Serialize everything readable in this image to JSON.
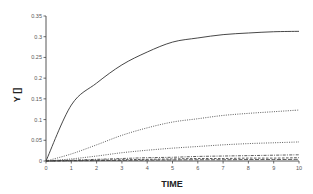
{
  "chart_data": {
    "type": "line",
    "title": "",
    "xlabel": "TIME",
    "ylabel": "Y []",
    "xlim": [
      0,
      10
    ],
    "ylim": [
      0,
      0.35
    ],
    "grid": false,
    "legend": "none",
    "x_ticks": [
      "0",
      "1",
      "2",
      "3",
      "4",
      "5",
      "6",
      "7",
      "8",
      "9",
      "10"
    ],
    "y_ticks": [
      "0",
      "0.05",
      "0.1",
      "0.15",
      "0.2",
      "0.25",
      "0.3",
      "0.35"
    ],
    "x": [
      0,
      1,
      2,
      3,
      4,
      5,
      6,
      7,
      8,
      9,
      10
    ],
    "series": [
      {
        "name": "solid",
        "style": "solid",
        "values": [
          0,
          0.135,
          0.188,
          0.232,
          0.263,
          0.287,
          0.297,
          0.305,
          0.309,
          0.312,
          0.313
        ]
      },
      {
        "name": "dotted-upper",
        "style": "dotted",
        "values": [
          0,
          0.017,
          0.039,
          0.062,
          0.08,
          0.094,
          0.102,
          0.11,
          0.115,
          0.119,
          0.123
        ]
      },
      {
        "name": "dotted-middle",
        "style": "dotted",
        "values": [
          0,
          0.005,
          0.012,
          0.02,
          0.026,
          0.031,
          0.035,
          0.039,
          0.042,
          0.044,
          0.046
        ]
      },
      {
        "name": "dash-dot",
        "style": "dashdot",
        "values": [
          0,
          0.002,
          0.004,
          0.006,
          0.008,
          0.009,
          0.011,
          0.012,
          0.013,
          0.014,
          0.015
        ]
      },
      {
        "name": "dashed",
        "style": "dashed",
        "values": [
          0,
          0.001,
          0.002,
          0.003,
          0.004,
          0.005,
          0.006,
          0.006,
          0.007,
          0.007,
          0.008
        ]
      },
      {
        "name": "long-dash",
        "style": "longdash",
        "values": [
          0,
          0.0005,
          0.001,
          0.0015,
          0.002,
          0.0025,
          0.003,
          0.003,
          0.0035,
          0.0035,
          0.004
        ]
      }
    ]
  },
  "colors": {
    "axis": "#444444",
    "line": "#333333",
    "text": "#555555"
  }
}
